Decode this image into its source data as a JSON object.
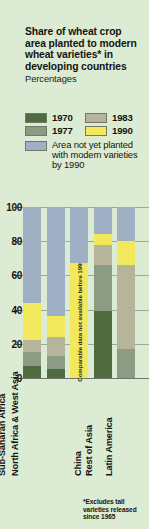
{
  "header": {
    "title": "Share of wheat crop area planted to modern wheat varieties* in developing countries",
    "subtitle": "Percentages"
  },
  "legend": {
    "items": [
      {
        "label": "1970",
        "color": "#4f6b3f"
      },
      {
        "label": "1983",
        "color": "#b6b49a"
      },
      {
        "label": "1977",
        "color": "#8b9b84"
      },
      {
        "label": "1990",
        "color": "#f2e85c"
      }
    ],
    "note_label": "Area not yet planted with modern varieties by 1990",
    "note_color": "#9fb0c4"
  },
  "footnote": "*Excludes tall varieties released since 1965",
  "chart_data": {
    "type": "bar",
    "title": "Share of wheat crop area planted to modern wheat varieties* in developing countries",
    "subtitle": "Percentages",
    "xlabel": "",
    "ylabel": "Percentages",
    "ylim": [
      0,
      100
    ],
    "yticks": [
      0,
      20,
      40,
      60,
      80,
      100
    ],
    "grid": true,
    "legend_position": "top",
    "stacked": true,
    "categories": [
      "Sub-Saharan Africa",
      "North Africa & West Asia",
      "China",
      "Rest of Asia",
      "Latin America"
    ],
    "series": [
      {
        "name": "1970",
        "color": "#4f6b3f",
        "values": [
          7,
          5,
          null,
          39,
          0
        ]
      },
      {
        "name": "1977",
        "color": "#8b9b84",
        "values": [
          15,
          13,
          null,
          66,
          17
        ]
      },
      {
        "name": "1983",
        "color": "#b6b49a",
        "values": [
          22,
          24,
          null,
          78,
          66
        ]
      },
      {
        "name": "1990",
        "color": "#f2e85c",
        "values": [
          44,
          36,
          67,
          84,
          80
        ]
      },
      {
        "name": "Area not yet planted with modern varieties by 1990",
        "color": "#9fb0c4",
        "values": [
          100,
          100,
          100,
          100,
          100
        ]
      }
    ],
    "annotations": [
      {
        "category": "China",
        "text": "Comparable data not available before 1990"
      }
    ]
  },
  "bars": [
    {
      "name": "Sub-Saharan Africa",
      "segments": [
        {
          "series": "1970",
          "from": 0,
          "to": 7,
          "color": "#4f6b3f"
        },
        {
          "series": "1977",
          "from": 7,
          "to": 15,
          "color": "#8b9b84"
        },
        {
          "series": "1983",
          "from": 15,
          "to": 22,
          "color": "#b6b49a"
        },
        {
          "series": "1990",
          "from": 22,
          "to": 44,
          "color": "#f2e85c"
        },
        {
          "series": "not-planted",
          "from": 44,
          "to": 100,
          "color": "#9fb0c4"
        }
      ]
    },
    {
      "name": "North Africa & West Asia",
      "segments": [
        {
          "series": "1970",
          "from": 0,
          "to": 5,
          "color": "#4f6b3f"
        },
        {
          "series": "1977",
          "from": 5,
          "to": 13,
          "color": "#8b9b84"
        },
        {
          "series": "1983",
          "from": 13,
          "to": 24,
          "color": "#b6b49a"
        },
        {
          "series": "1990",
          "from": 24,
          "to": 36,
          "color": "#f2e85c"
        },
        {
          "series": "not-planted",
          "from": 36,
          "to": 100,
          "color": "#9fb0c4"
        }
      ]
    },
    {
      "name": "China",
      "segments": [
        {
          "series": "1990",
          "from": 0,
          "to": 67,
          "color": "#f2e85c",
          "label": "Comparable data not available before 1990"
        },
        {
          "series": "not-planted",
          "from": 67,
          "to": 100,
          "color": "#9fb0c4"
        }
      ]
    },
    {
      "name": "Rest of Asia",
      "segments": [
        {
          "series": "1970",
          "from": 0,
          "to": 39,
          "color": "#4f6b3f"
        },
        {
          "series": "1977",
          "from": 39,
          "to": 66,
          "color": "#8b9b84"
        },
        {
          "series": "1983",
          "from": 66,
          "to": 78,
          "color": "#b6b49a"
        },
        {
          "series": "1990",
          "from": 78,
          "to": 84,
          "color": "#f2e85c"
        },
        {
          "series": "not-planted",
          "from": 84,
          "to": 100,
          "color": "#9fb0c4"
        }
      ]
    },
    {
      "name": "Latin America",
      "segments": [
        {
          "series": "1977",
          "from": 0,
          "to": 17,
          "color": "#8b9b84"
        },
        {
          "series": "1983",
          "from": 17,
          "to": 66,
          "color": "#b6b49a"
        },
        {
          "series": "1990",
          "from": 66,
          "to": 80,
          "color": "#f2e85c"
        },
        {
          "series": "not-planted",
          "from": 80,
          "to": 100,
          "color": "#9fb0c4"
        }
      ]
    }
  ]
}
